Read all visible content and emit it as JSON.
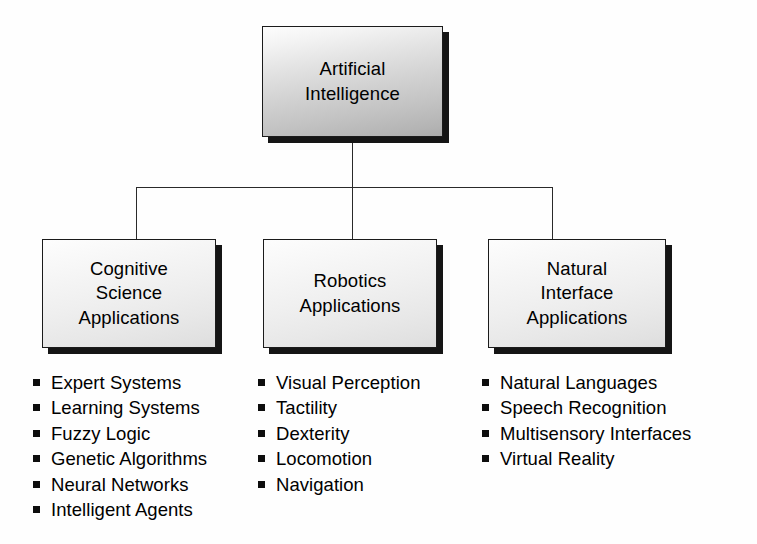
{
  "diagram": {
    "type": "organizational-hierarchy-tree",
    "root": {
      "label": "Artificial\nIntelligence"
    },
    "branches": [
      {
        "label": "Cognitive\nScience\nApplications",
        "items": [
          "Expert Systems",
          "Learning Systems",
          "Fuzzy Logic",
          "Genetic Algorithms",
          "Neural Networks",
          "Intelligent Agents"
        ]
      },
      {
        "label": "Robotics\nApplications",
        "items": [
          "Visual Perception",
          "Tactility",
          "Dexterity",
          "Locomotion",
          "Navigation"
        ]
      },
      {
        "label": "Natural\nInterface\nApplications",
        "items": [
          "Natural Languages",
          "Speech Recognition",
          "Multisensory Interfaces",
          "Virtual Reality"
        ]
      }
    ],
    "style": {
      "background": "#fefefe",
      "box_border": "#1b1b1b",
      "box_shadow": "#151515",
      "root_fill_top": "#fdfdfd",
      "root_fill_bottom": "#ababab",
      "child_fill_top": "#fdfdfd",
      "child_fill_bottom": "#dcdcdc",
      "connector": "#2a2a2a",
      "bullet_marker": "#0d0d0d",
      "text": "#000000"
    }
  }
}
